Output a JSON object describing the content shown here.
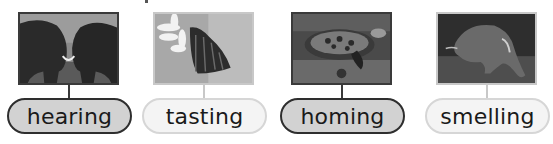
{
  "cards": [
    {
      "label": "hearing",
      "animal": "elephants",
      "style": "dark"
    },
    {
      "label": "tasting",
      "animal": "monarch butterfly on flower",
      "style": "light"
    },
    {
      "label": "homing",
      "animal": "sea turtle",
      "style": "dark"
    },
    {
      "label": "smelling",
      "animal": "aardvark",
      "style": "light"
    }
  ]
}
